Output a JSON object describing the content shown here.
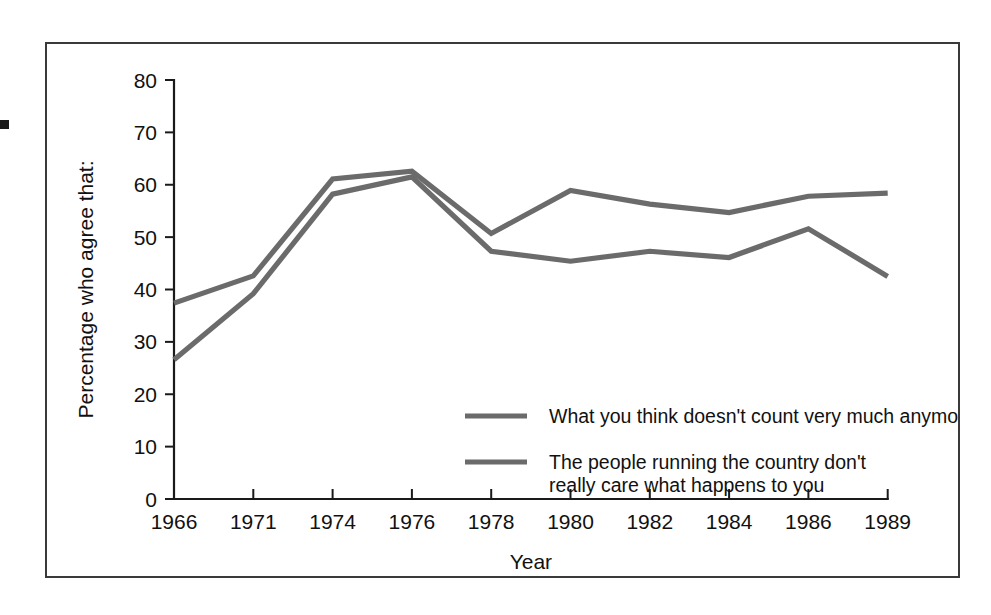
{
  "figure": {
    "edge_mark": "black-square-margin-mark"
  },
  "chart_data": {
    "type": "line",
    "title": "",
    "xlabel": "Year",
    "ylabel": "Percentage who agree that:",
    "categories": [
      "1966",
      "1971",
      "1974",
      "1976",
      "1978",
      "1980",
      "1982",
      "1984",
      "1986",
      "1989"
    ],
    "x_tick_labels": [
      "1966",
      "1971",
      "1974",
      "1976",
      "1978",
      "1980",
      "1982",
      "1984",
      "1986",
      "1989"
    ],
    "y_tick_labels": [
      "0",
      "10",
      "20",
      "30",
      "40",
      "50",
      "60",
      "70",
      "80"
    ],
    "y_ticks": [
      0,
      10,
      20,
      30,
      40,
      50,
      60,
      70,
      80
    ],
    "ylim": [
      0,
      80
    ],
    "grid": false,
    "legend_position": "inside-center-right",
    "series": [
      {
        "name": "What you think doesn't count very much anymore",
        "color": "#6b6b6b",
        "values": [
          37.4,
          42.6,
          61.1,
          62.6,
          50.7,
          58.9,
          56.3,
          54.7,
          57.8,
          58.4
        ]
      },
      {
        "name": "The people running the country don't really care what happens to you",
        "color": "#6b6b6b",
        "values": [
          26.6,
          39.2,
          58.2,
          61.5,
          47.3,
          45.4,
          47.3,
          46.1,
          51.6,
          42.5
        ]
      }
    ],
    "legend": [
      {
        "line1": "What you think doesn't count very much anymore",
        "line2": ""
      },
      {
        "line1": "The people running the country don't",
        "line2": "really care what happens to you"
      }
    ]
  }
}
